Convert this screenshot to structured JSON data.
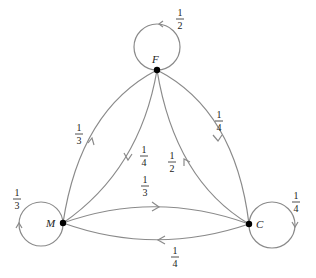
{
  "diagram": {
    "type": "markov-chain",
    "nodes": [
      {
        "id": "F",
        "label": "F"
      },
      {
        "id": "M",
        "label": "M"
      },
      {
        "id": "C",
        "label": "C"
      }
    ],
    "edges": [
      {
        "from": "F",
        "to": "F",
        "num": "1",
        "den": "2"
      },
      {
        "from": "M",
        "to": "M",
        "num": "1",
        "den": "3"
      },
      {
        "from": "C",
        "to": "C",
        "num": "1",
        "den": "4"
      },
      {
        "from": "M",
        "to": "F",
        "num": "1",
        "den": "3"
      },
      {
        "from": "F",
        "to": "M",
        "num": "1",
        "den": "4"
      },
      {
        "from": "F",
        "to": "C",
        "num": "1",
        "den": "4"
      },
      {
        "from": "C",
        "to": "F",
        "num": "1",
        "den": "2"
      },
      {
        "from": "M",
        "to": "C",
        "num": "1",
        "den": "3"
      },
      {
        "from": "C",
        "to": "M",
        "num": "1",
        "den": "4"
      }
    ]
  }
}
